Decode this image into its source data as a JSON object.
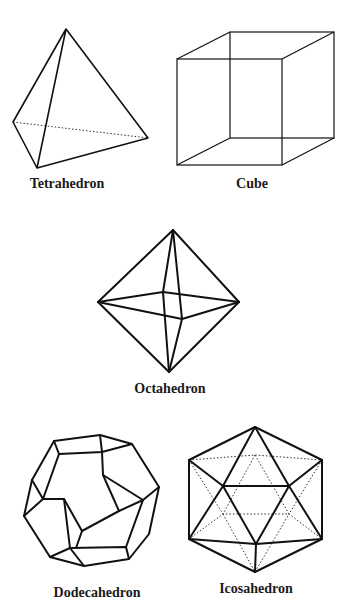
{
  "figure": {
    "solids": [
      {
        "name": "Tetrahedron",
        "label": "Tetrahedron"
      },
      {
        "name": "Cube",
        "label": "Cube"
      },
      {
        "name": "Octahedron",
        "label": "Octahedron"
      },
      {
        "name": "Dodecahedron",
        "label": "Dodecahedron"
      },
      {
        "name": "Icosahedron",
        "label": "Icosahedron"
      }
    ]
  },
  "colors": {
    "line": "#111111",
    "background": "#ffffff"
  }
}
